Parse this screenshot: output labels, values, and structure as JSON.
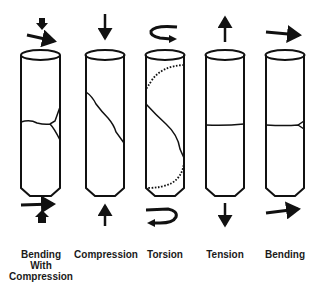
{
  "diagram": {
    "title": "",
    "stroke_color": "#111111",
    "background": "#ffffff",
    "specimens": [
      {
        "id": "bending-with-compression",
        "label_lines": [
          "Bending",
          "With",
          "Compression"
        ],
        "top_load": "downward arrow + rightward bending arrow",
        "bottom_load": "rightward arrow + upward arrow",
        "fracture": "transverse crack with Y-branch near right edge"
      },
      {
        "id": "compression",
        "label_lines": [
          "Compression"
        ],
        "top_load": "downward arrow",
        "bottom_load": "upward arrow",
        "fracture": "oblique crack"
      },
      {
        "id": "torsion",
        "label_lines": [
          "Torsion"
        ],
        "top_load": "twist arrow",
        "bottom_load": "opposite twist arrow",
        "fracture": "spiral crack (solid front, dotted back)"
      },
      {
        "id": "tension",
        "label_lines": [
          "Tension"
        ],
        "top_load": "upward arrow",
        "bottom_load": "downward arrow",
        "fracture": "transverse crack"
      },
      {
        "id": "bending",
        "label_lines": [
          "Bending"
        ],
        "top_load": "rightward arrow",
        "bottom_load": "rightward arrow",
        "fracture": "transverse crack with small butterfly fragment at right"
      }
    ]
  }
}
